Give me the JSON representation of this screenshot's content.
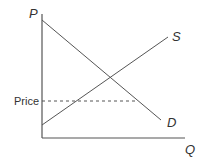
{
  "diagram": {
    "type": "supply-demand",
    "axes": {
      "y_label": "P",
      "x_label": "Q",
      "origin": [
        42,
        138
      ],
      "y_top": 14,
      "x_right": 185,
      "color": "#555555"
    },
    "curves": {
      "demand": {
        "label": "D",
        "from": [
          42,
          20
        ],
        "to": [
          161,
          120
        ],
        "color": "#555555"
      },
      "supply": {
        "label": "S",
        "from": [
          42,
          125
        ],
        "to": [
          168,
          37
        ],
        "color": "#555555"
      }
    },
    "price_line": {
      "label": "Price",
      "y": 101,
      "x_end": 136,
      "style": "dashed",
      "color": "#555555"
    }
  }
}
